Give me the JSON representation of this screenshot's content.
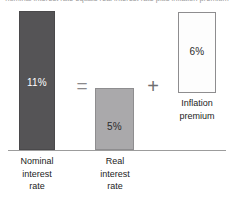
{
  "figure": {
    "cut_off_caption": "nominal interest rate equals real interest rate plus inflation premium",
    "operators": {
      "equals": "=",
      "plus": "+"
    }
  },
  "chart_data": {
    "type": "bar",
    "title": "",
    "subtitle": "",
    "xlabel": "",
    "ylabel": "",
    "ylim": [
      0,
      12
    ],
    "grid": false,
    "legend": "none",
    "categories": [
      "Nominal interest rate",
      "Real interest rate",
      "Inflation premium"
    ],
    "values": [
      11,
      5,
      6
    ],
    "value_labels": [
      "11%",
      "5%",
      "6%"
    ],
    "colors": [
      "#555456",
      "#aaa9ab",
      "#fdfdfd"
    ],
    "bars": [
      {
        "id": "nominal",
        "value": 11,
        "value_label": "11%",
        "label_line1": "Nominal",
        "label_line2": "interest",
        "label_line3": "rate",
        "fill": "#555456",
        "stroke": "#4a494b",
        "value_text_color": "#ffffff"
      },
      {
        "id": "real",
        "value": 5,
        "value_label": "5%",
        "label_line1": "Real",
        "label_line2": "interest",
        "label_line3": "rate",
        "fill": "#aaa9ab",
        "stroke": "#8e8d8f",
        "value_text_color": "#2b2b2b"
      },
      {
        "id": "inflation",
        "value": 6,
        "value_label": "6%",
        "label_line1": "Inflation",
        "label_line2": "premium",
        "label_line3": "",
        "fill": "#fdfdfd",
        "stroke": "#8e8d8f",
        "value_text_color": "#2b2b2b"
      }
    ],
    "equation": "11% = 5% + 6%",
    "annotations": [
      {
        "text": "=",
        "between": [
          "nominal",
          "real"
        ]
      },
      {
        "text": "+",
        "between": [
          "real",
          "inflation"
        ]
      }
    ],
    "baseline_color": "#9c9c9c"
  }
}
